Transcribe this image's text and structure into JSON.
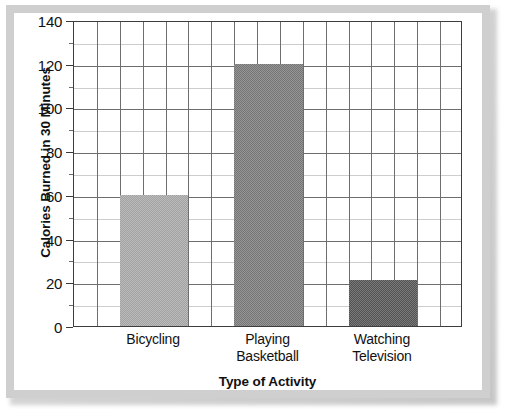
{
  "chart_data": {
    "type": "bar",
    "title": "",
    "xlabel": "Type of Activity",
    "ylabel": "Calories Burned in 30 Minutes",
    "categories": [
      "Bicycling",
      "Playing Basketball",
      "Watching Television"
    ],
    "category_lines": [
      [
        "Bicycling"
      ],
      [
        "Playing",
        "Basketball"
      ],
      [
        "Watching",
        "Television"
      ]
    ],
    "values": [
      60,
      120,
      21
    ],
    "ylim": [
      0,
      140
    ],
    "ytick_labels": [
      "0",
      "20",
      "40",
      "60",
      "80",
      "100",
      "120",
      "140"
    ],
    "ytick_values": [
      0,
      20,
      40,
      60,
      80,
      100,
      120,
      140
    ],
    "yminor_step": 10,
    "grid": true,
    "grid_vertical_columns": 17,
    "legend": "none",
    "bar_colors": [
      "#ababab",
      "#7c7c7c",
      "#585858"
    ]
  },
  "figure": {
    "frame_color": "#cfcfcf",
    "plot_border_color": "#3d3d3d",
    "major_grid_color": "#6e6e6e",
    "minor_grid_color": "#cdcdcd",
    "background": "#ffffff"
  }
}
